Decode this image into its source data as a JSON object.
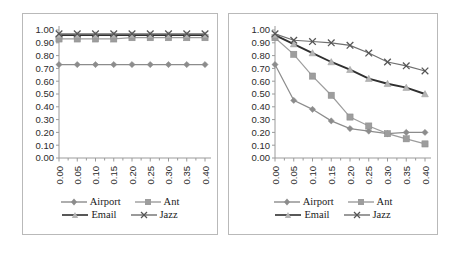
{
  "figure": {
    "panels": [
      "left",
      "right"
    ]
  },
  "legend": {
    "rows": [
      [
        {
          "label": "Airport",
          "marker": "diamond",
          "color": "#8c8c8c"
        },
        {
          "label": "Ant",
          "marker": "square",
          "color": "#9d9d9d"
        }
      ],
      [
        {
          "label": "Email",
          "marker": "triangle",
          "color": "#2f2f2f"
        },
        {
          "label": "Jazz",
          "marker": "cross",
          "color": "#6f6f6f"
        }
      ]
    ]
  },
  "axis": {
    "y_ticks": [
      "0.00",
      "0.10",
      "0.20",
      "0.30",
      "0.40",
      "0.50",
      "0.60",
      "0.70",
      "0.80",
      "0.90",
      "1.00"
    ],
    "x_ticks": [
      "0.00",
      "0.05",
      "0.10",
      "0.15",
      "0.20",
      "0.25",
      "0.30",
      "0.35",
      "0.40"
    ]
  },
  "chart_data": [
    {
      "type": "line",
      "panel": "left",
      "title": "",
      "xlabel": "",
      "ylabel": "",
      "xlim": [
        0.0,
        0.4
      ],
      "ylim": [
        0.0,
        1.0
      ],
      "grid": false,
      "legend_position": "bottom",
      "x": [
        0.0,
        0.05,
        0.1,
        0.15,
        0.2,
        0.25,
        0.3,
        0.35,
        0.4
      ],
      "series": [
        {
          "name": "Airport",
          "marker": "diamond",
          "color": "#8c8c8c",
          "values": [
            0.73,
            0.73,
            0.73,
            0.73,
            0.73,
            0.73,
            0.73,
            0.73,
            0.73
          ]
        },
        {
          "name": "Ant",
          "marker": "square",
          "color": "#9d9d9d",
          "values": [
            0.93,
            0.93,
            0.93,
            0.93,
            0.94,
            0.94,
            0.94,
            0.94,
            0.94
          ]
        },
        {
          "name": "Email",
          "marker": "triangle",
          "color": "#2f2f2f",
          "values": [
            0.96,
            0.96,
            0.96,
            0.96,
            0.96,
            0.96,
            0.96,
            0.96,
            0.96
          ]
        },
        {
          "name": "Jazz",
          "marker": "cross",
          "color": "#6f6f6f",
          "values": [
            0.97,
            0.97,
            0.97,
            0.97,
            0.97,
            0.97,
            0.97,
            0.97,
            0.97
          ]
        }
      ]
    },
    {
      "type": "line",
      "panel": "right",
      "title": "",
      "xlabel": "",
      "ylabel": "",
      "xlim": [
        0.0,
        0.4
      ],
      "ylim": [
        0.0,
        1.0
      ],
      "grid": false,
      "legend_position": "bottom",
      "x": [
        0.0,
        0.05,
        0.1,
        0.15,
        0.2,
        0.25,
        0.3,
        0.35,
        0.4
      ],
      "series": [
        {
          "name": "Airport",
          "marker": "diamond",
          "color": "#8c8c8c",
          "values": [
            0.73,
            0.45,
            0.38,
            0.29,
            0.23,
            0.21,
            0.19,
            0.2,
            0.2
          ]
        },
        {
          "name": "Ant",
          "marker": "square",
          "color": "#9d9d9d",
          "values": [
            0.94,
            0.81,
            0.64,
            0.49,
            0.32,
            0.25,
            0.19,
            0.15,
            0.11
          ]
        },
        {
          "name": "Email",
          "marker": "triangle",
          "color": "#2f2f2f",
          "values": [
            0.96,
            0.89,
            0.82,
            0.75,
            0.69,
            0.62,
            0.58,
            0.55,
            0.5
          ]
        },
        {
          "name": "Jazz",
          "marker": "cross",
          "color": "#6f6f6f",
          "values": [
            0.97,
            0.92,
            0.91,
            0.9,
            0.88,
            0.82,
            0.75,
            0.72,
            0.68
          ]
        }
      ]
    }
  ]
}
